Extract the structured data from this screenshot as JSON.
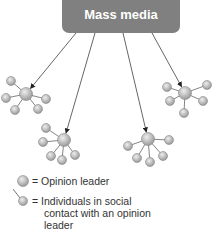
{
  "diagram": {
    "title_box": {
      "label": "Mass media",
      "fill": "#808080"
    },
    "colors": {
      "node_fill_light": "#e8e8e8",
      "node_fill_dark": "#9a9a9a",
      "node_stroke": "#888888",
      "edge": "#555555",
      "arrow": "#333333"
    },
    "clusters": [
      {
        "id": "cluster-left",
        "leader": [
          26,
          94
        ],
        "contacts": [
          [
            11,
            81
          ],
          [
            6,
            98
          ],
          [
            15,
            110
          ],
          [
            38,
            109
          ],
          [
            46,
            99
          ]
        ],
        "arrow_from": [
          76,
          33
        ]
      },
      {
        "id": "cluster-right",
        "leader": [
          185,
          93
        ],
        "contacts": [
          [
            167,
            87
          ],
          [
            207,
            85
          ],
          [
            170,
            101
          ],
          [
            203,
            101
          ],
          [
            184,
            113
          ]
        ],
        "arrow_from": [
          152,
          33
        ]
      },
      {
        "id": "cluster-mid-left",
        "leader": [
          64,
          140
        ],
        "contacts": [
          [
            46,
            128
          ],
          [
            43,
            142
          ],
          [
            51,
            156
          ],
          [
            62,
            160
          ],
          [
            75,
            155
          ]
        ],
        "arrow_from": [
          95,
          33
        ]
      },
      {
        "id": "cluster-mid-right",
        "leader": [
          148,
          139
        ],
        "contacts": [
          [
            128,
            146
          ],
          [
            169,
            140
          ],
          [
            137,
            158
          ],
          [
            150,
            162
          ],
          [
            163,
            156
          ]
        ],
        "arrow_from": [
          123,
          33
        ]
      }
    ]
  },
  "legend": {
    "opinion_leader": "= Opinion leader",
    "individuals_line1": "= Individuals in social",
    "individuals_line2": "contact with an opinion",
    "individuals_line3": "leader"
  }
}
